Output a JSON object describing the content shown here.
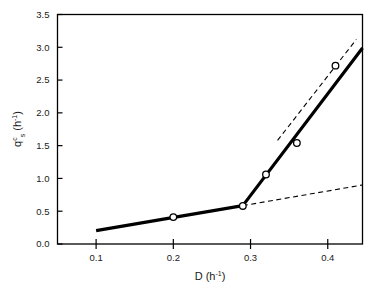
{
  "chart_data": {
    "type": "line",
    "title": "",
    "xlabel": "D (h⁻¹)",
    "ylabel": "qᶜₛ (h⁻¹)",
    "xlabel_parts": {
      "base": "D (h",
      "exponent": "-1",
      "close": ")"
    },
    "ylabel_parts": {
      "base": "q",
      "superscript": "c",
      "subscript": "s",
      "unit_open": " (h",
      "unit_exponent": "-1",
      "unit_close": ")"
    },
    "xlim": [
      0.05,
      0.445
    ],
    "ylim": [
      0.0,
      3.5
    ],
    "xticks": [
      0.1,
      0.2,
      0.3,
      0.4
    ],
    "xtick_labels": [
      "0.1",
      "0.2",
      "0.3",
      "0.4"
    ],
    "yticks": [
      0.0,
      0.5,
      1.0,
      1.5,
      2.0,
      2.5,
      3.0,
      3.5
    ],
    "ytick_labels": [
      "0.0",
      "0.5",
      "1.0",
      "1.5",
      "2.0",
      "2.5",
      "3.0",
      "3.5"
    ],
    "grid": false,
    "legend": null,
    "frame": "box",
    "series": [
      {
        "name": "measured data points",
        "style": "markers",
        "marker": "open-circle",
        "marker_color": "#000000",
        "marker_fill": "#ffffff",
        "points": [
          {
            "x": 0.2,
            "y": 0.41
          },
          {
            "x": 0.29,
            "y": 0.58
          },
          {
            "x": 0.32,
            "y": 1.06
          },
          {
            "x": 0.36,
            "y": 1.54
          },
          {
            "x": 0.41,
            "y": 2.72
          }
        ]
      },
      {
        "name": "two-phase fit (solid)",
        "style": "solid-line",
        "color": "#000000",
        "width": 3.2,
        "points": [
          {
            "x": 0.1,
            "y": 0.205
          },
          {
            "x": 0.29,
            "y": 0.585
          },
          {
            "x": 0.445,
            "y": 2.99
          }
        ]
      },
      {
        "name": "low-rate extrapolation (dashed)",
        "style": "dashed-line",
        "color": "#000000",
        "width": 1.1,
        "points": [
          {
            "x": 0.29,
            "y": 0.585
          },
          {
            "x": 0.445,
            "y": 0.9
          }
        ]
      },
      {
        "name": "high-rate extrapolation (dashed)",
        "style": "dashed-line",
        "color": "#000000",
        "width": 1.1,
        "points": [
          {
            "x": 0.335,
            "y": 1.58
          },
          {
            "x": 0.437,
            "y": 3.12
          }
        ]
      }
    ]
  },
  "figure": {
    "background": "#ffffff",
    "axis_color": "#000000",
    "text_color": "#1a1a1a"
  }
}
